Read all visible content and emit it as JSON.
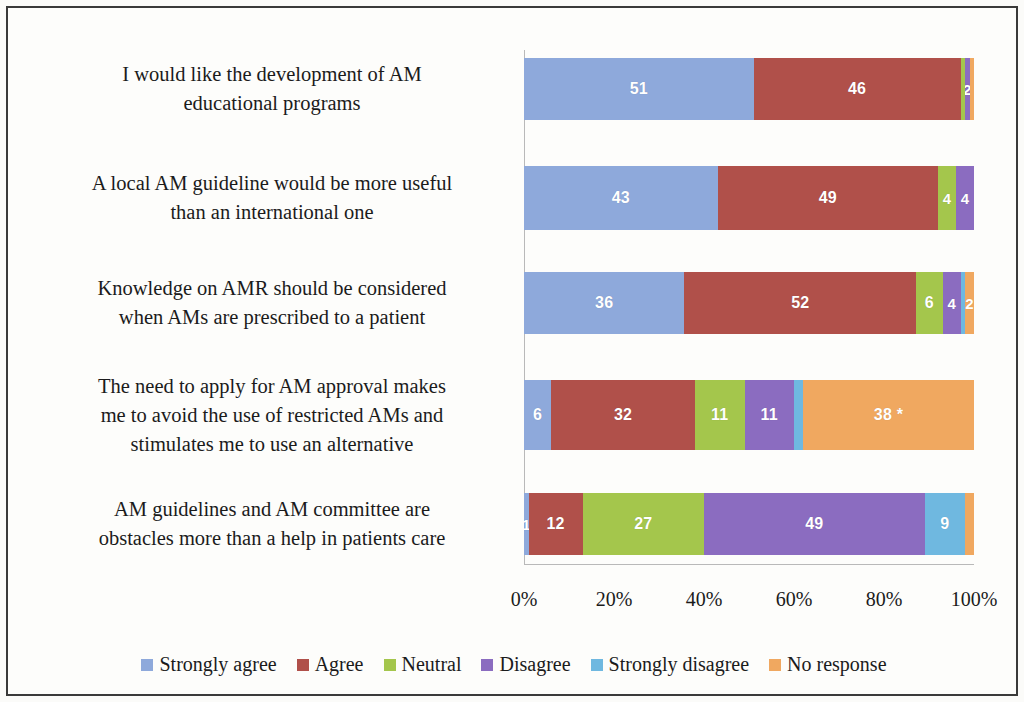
{
  "chart_data": {
    "type": "bar",
    "subtype": "100% stacked horizontal bar",
    "title": "",
    "xlabel": "",
    "ylabel": "",
    "xlim": [
      0,
      100
    ],
    "grid": false,
    "legend_position": "bottom",
    "x_ticks": [
      "0%",
      "20%",
      "40%",
      "60%",
      "80%",
      "100%"
    ],
    "x_tick_values": [
      0,
      20,
      40,
      60,
      80,
      100
    ],
    "categories": [
      "I would like the development of  AM educational programs",
      "A local AM guideline would be more useful than an international one",
      "Knowledge on AMR should be considered when AMs are prescribed to a patient",
      "The need to apply for AM approval makes me to avoid the use of restricted AMs and stimulates me to use an alternative",
      "AM guidelines and AM committee are obstacles more than a help in patients care"
    ],
    "category_lines": [
      [
        "I would like the development of  AM",
        "educational programs"
      ],
      [
        "A local AM guideline would be more useful",
        "than an international one"
      ],
      [
        "Knowledge on AMR should be considered",
        "when AMs are prescribed to a patient"
      ],
      [
        "The need to apply for AM approval makes",
        "me to avoid the use of restricted AMs and",
        "stimulates me to use an alternative"
      ],
      [
        "AM guidelines and AM committee are",
        "obstacles more than a help in patients care"
      ]
    ],
    "series": [
      {
        "name": "Strongly agree",
        "color": "#8ea9db",
        "values": [
          51,
          43,
          36,
          6,
          1
        ]
      },
      {
        "name": "Agree",
        "color": "#b0504a",
        "values": [
          46,
          49,
          52,
          32,
          12
        ]
      },
      {
        "name": "Neutral",
        "color": "#a4c64c",
        "values": [
          1,
          4,
          6,
          11,
          27
        ]
      },
      {
        "name": "Disagree",
        "color": "#8b6cc0",
        "values": [
          1,
          4,
          4,
          11,
          49
        ]
      },
      {
        "name": "Strongly disagree",
        "color": "#6fb8e0",
        "values": [
          0,
          0,
          1,
          2,
          9
        ]
      },
      {
        "name": "No response",
        "color": "#f0a860",
        "values": [
          1,
          0,
          2,
          38,
          2
        ]
      }
    ],
    "bar_labels": [
      [
        "51",
        "46",
        "",
        "2",
        "",
        ""
      ],
      [
        "43",
        "49",
        "4",
        "4",
        "0",
        ""
      ],
      [
        "36",
        "52",
        "6",
        "4",
        "",
        "2"
      ],
      [
        "6",
        "32",
        "11",
        "11",
        "",
        "38 *"
      ],
      [
        "1",
        "12",
        "27",
        "49",
        "9",
        ""
      ]
    ]
  },
  "legend": {
    "items": [
      {
        "label": "Strongly agree",
        "color": "#8ea9db"
      },
      {
        "label": "Agree",
        "color": "#b0504a"
      },
      {
        "label": "Neutral",
        "color": "#a4c64c"
      },
      {
        "label": "Disagree",
        "color": "#8b6cc0"
      },
      {
        "label": "Strongly disagree",
        "color": "#6fb8e0"
      },
      {
        "label": "No response",
        "color": "#f0a860"
      }
    ]
  }
}
